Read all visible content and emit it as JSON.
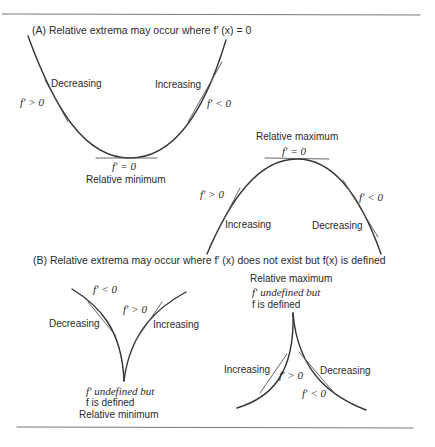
{
  "section_a": {
    "heading": "(A) Relative extrema may occur where f′ (x) = 0",
    "minimum_curve": {
      "left_label": "Decreasing",
      "left_slope": "f′ > 0",
      "right_label": "Increasing",
      "right_slope": "f′ < 0",
      "bottom_slope": "f′ = 0",
      "bottom_caption": "Relative minimum"
    },
    "maximum_curve": {
      "top_caption": "Relative maximum",
      "top_slope": "f′ = 0",
      "left_slope": "f′ > 0",
      "left_label": "Increasing",
      "right_slope": "f′ < 0",
      "right_label": "Decreasing"
    }
  },
  "section_b": {
    "heading": "(B) Relative extrema may occur where f′ (x) does not exist but f(x) is defined",
    "cusp_minimum": {
      "left_slope": "f′ < 0",
      "left_label": "Decreasing",
      "right_slope": "f′ > 0",
      "right_label": "Increasing",
      "caption_line1": "f′  undefined but",
      "caption_line2": "f is defined",
      "caption_line3": "Relative minimum"
    },
    "cusp_maximum": {
      "caption_line1": "Relative maximum",
      "caption_line2": "f′  undefined but",
      "caption_line3": "f is defined",
      "left_label": "Increasing",
      "left_slope": "f′ > 0",
      "right_label": "Decreasing",
      "right_slope": "f′ < 0"
    }
  }
}
